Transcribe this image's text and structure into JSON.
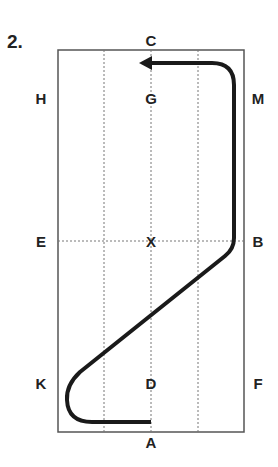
{
  "figure": {
    "number_label": "2.",
    "arena_letters": {
      "top": "C",
      "bottom": "A",
      "left_upper": "H",
      "left_middle": "E",
      "left_lower": "K",
      "right_upper": "M",
      "right_middle": "B",
      "right_lower": "F",
      "center_upper": "G",
      "center_middle": "X",
      "center_lower": "D"
    },
    "colors": {
      "border": "#555555",
      "gridline": "#777777",
      "path": "#1a1a1a",
      "text": "#222222"
    },
    "path_description": "From A track left to K corner, diagonal across to B, up the right track to M, turn left at C end finishing toward G with arrow"
  }
}
